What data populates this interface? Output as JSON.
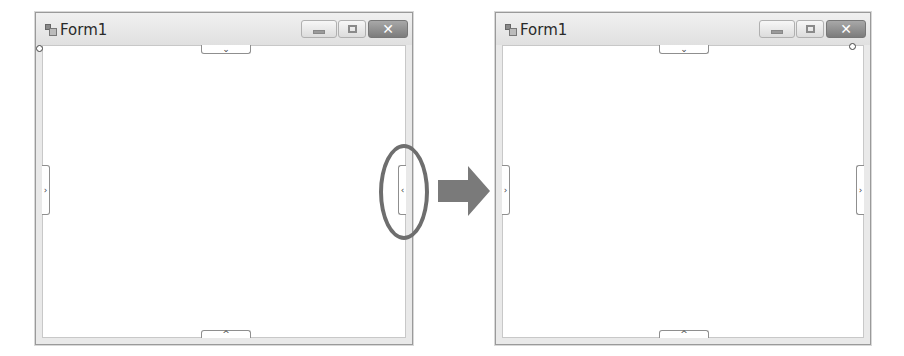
{
  "figure": {
    "colors": {
      "highlight_ellipse": "#6e6e6e",
      "arrow": "#7a7a7a",
      "close_button": "#8a8a8a",
      "window_border": "#9a9a9a"
    }
  },
  "before_window": {
    "title": "Form1",
    "icon": "app-window-icon",
    "controls": {
      "minimize": "minimize-icon",
      "maximize": "maximize-icon",
      "close_label": "✕"
    },
    "edge_tabs": {
      "top": "⌄",
      "left": "›",
      "right": "‹",
      "bottom": "^"
    },
    "resize_handle_position": "top-left"
  },
  "arrow": {
    "icon": "right-arrow-icon"
  },
  "after_window": {
    "title": "Form1",
    "icon": "app-window-icon",
    "controls": {
      "minimize": "minimize-icon",
      "maximize": "maximize-icon",
      "close_label": "✕"
    },
    "edge_tabs": {
      "top": "⌄",
      "left": "›",
      "right": "›",
      "bottom": "^"
    },
    "resize_handle_position": "top-right"
  }
}
